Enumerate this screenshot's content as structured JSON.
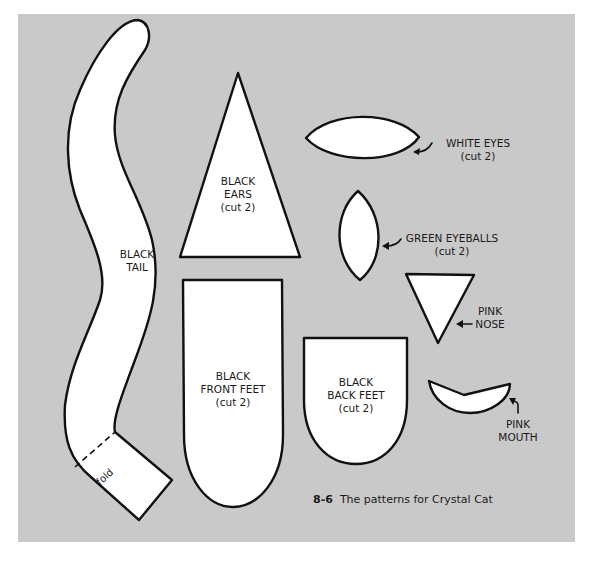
{
  "figure": {
    "number": "8-6",
    "caption": "The patterns for Crystal Cat",
    "background_color": "#c9c9c9",
    "piece_fill": "#ffffff",
    "outline_color": "#111111"
  },
  "pieces": {
    "tail": {
      "line1": "BLACK",
      "line2": "TAIL",
      "fold_label": "fold"
    },
    "ears": {
      "line1": "BLACK",
      "line2": "EARS",
      "line3": "(cut 2)"
    },
    "front_feet": {
      "line1": "BLACK",
      "line2": "FRONT FEET",
      "line3": "(cut 2)"
    },
    "back_feet": {
      "line1": "BLACK",
      "line2": "BACK FEET",
      "line3": "(cut 2)"
    },
    "white_eyes": {
      "line1": "WHITE EYES",
      "line2": "(cut 2)"
    },
    "green_eyeballs": {
      "line1": "GREEN EYEBALLS",
      "line2": "(cut 2)"
    },
    "nose": {
      "line1": "PINK",
      "line2": "NOSE"
    },
    "mouth": {
      "line1": "PINK",
      "line2": "MOUTH"
    }
  }
}
